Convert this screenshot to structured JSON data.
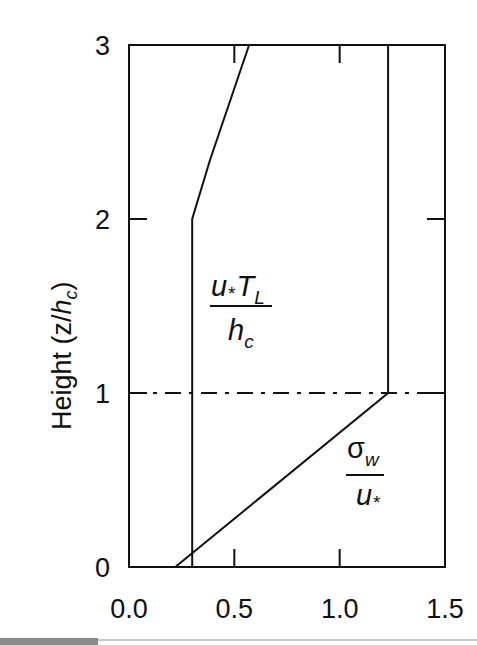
{
  "chart_data": {
    "type": "line",
    "title": "",
    "xlabel": "",
    "ylabel": "Height (z/h_c)",
    "ylabel_parts": {
      "main": "Height (z/",
      "italic": "h",
      "sub": "c",
      "close": ")"
    },
    "xlim": [
      0.0,
      1.5
    ],
    "ylim": [
      0,
      3
    ],
    "x_ticks": [
      0.0,
      0.5,
      1.0,
      1.5
    ],
    "x_tick_labels": [
      "0.0",
      "0.5",
      "1.0",
      "1.5"
    ],
    "y_ticks": [
      0,
      1,
      2,
      3
    ],
    "y_tick_labels": [
      "0",
      "1",
      "2",
      "3"
    ],
    "grid": false,
    "legend": "none (inline annotations)",
    "series": [
      {
        "name": "u*T_L/h_c",
        "label_numerator": {
          "u": "u",
          "star": "*",
          "T": "T",
          "sub": "L"
        },
        "label_denominator": {
          "h": "h",
          "sub": "c"
        },
        "points": [
          [
            0.3,
            0.0
          ],
          [
            0.3,
            2.0
          ],
          [
            0.385,
            2.34
          ],
          [
            0.57,
            3.0
          ]
        ]
      },
      {
        "name": "σw/u*",
        "label_numerator": {
          "sigma": "σ",
          "sub": "w"
        },
        "label_denominator": {
          "u": "u",
          "star": "*"
        },
        "points": [
          [
            0.22,
            0.0
          ],
          [
            1.23,
            1.0
          ],
          [
            1.23,
            3.0
          ]
        ]
      }
    ],
    "annotations": [
      {
        "type": "hline",
        "y": 1.0,
        "style": "dash-dot",
        "description": "canopy height z = h_c"
      }
    ]
  }
}
